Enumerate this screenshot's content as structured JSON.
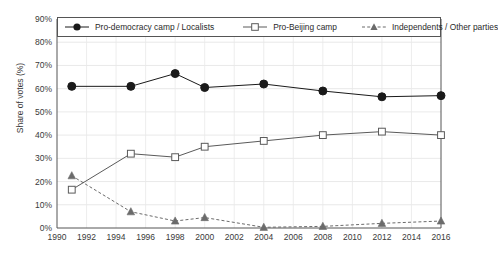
{
  "chart_data": {
    "type": "line",
    "title": "",
    "subtitle": "",
    "xlabel": "",
    "ylabel": "Share of votes (%)",
    "x": [
      1991,
      1995,
      1998,
      2000,
      2004,
      2008,
      2012,
      2016
    ],
    "xlim": [
      1990,
      2016
    ],
    "ylim": [
      0,
      90
    ],
    "xticks": [
      1990,
      1992,
      1994,
      1996,
      1998,
      2000,
      2002,
      2004,
      2006,
      2008,
      2010,
      2012,
      2014,
      2016
    ],
    "xtick_labels": [
      "1990",
      "1992",
      "1994",
      "1996",
      "1998",
      "2000",
      "2002",
      "2004",
      "2006",
      "2008",
      "2010",
      "2012",
      "2014",
      "2016"
    ],
    "yticks": [
      0,
      10,
      20,
      30,
      40,
      50,
      60,
      70,
      80,
      90
    ],
    "ytick_labels": [
      "0%",
      "10%",
      "20%",
      "30%",
      "40%",
      "50%",
      "60%",
      "70%",
      "80%",
      "90%"
    ],
    "grid": true,
    "grid_axis": "both",
    "legend_position": "top-inside",
    "series": [
      {
        "name": "Pro-democracy camp / Localists",
        "values": [
          61,
          61,
          66.5,
          60.5,
          62,
          59,
          56.5,
          57
        ],
        "marker": "filled-circle",
        "line_style": "solid",
        "color": "#1a1a1a"
      },
      {
        "name": "Pro-Beijing camp",
        "values": [
          16.5,
          32,
          30.5,
          35,
          37.5,
          40,
          41.5,
          40
        ],
        "marker": "open-square",
        "line_style": "solid",
        "color": "#5a5a5a"
      },
      {
        "name": "Independents / Other parties",
        "values": [
          22.5,
          7,
          3,
          4.5,
          0.3,
          0.7,
          2,
          3
        ],
        "marker": "filled-triangle",
        "line_style": "dashed",
        "color": "#6b6b6b"
      }
    ]
  },
  "legend": {
    "items": [
      {
        "label": "Pro-democracy camp / Localists"
      },
      {
        "label": "Pro-Beijing camp"
      },
      {
        "label": "Independents / Other parties"
      }
    ]
  },
  "axes": {
    "y_title": "Share of votes (%)"
  }
}
